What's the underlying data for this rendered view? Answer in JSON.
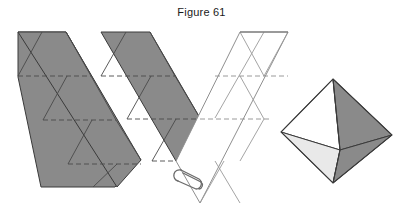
{
  "figure": {
    "caption": "Figure 61",
    "background_color": "#ffffff"
  },
  "palette": {
    "shaded_face": "#8a8a8a",
    "shaded_face_dark": "#7e7e7e",
    "unshaded_face": "#ffffff",
    "pale_face": "#e9e9e9",
    "outline": "#3a3a3a",
    "fold_line": "#4a4a4a",
    "dashed_fold": "#4a4a4a",
    "light_edge": "#9a9a9a",
    "paperclip": "#6b6b6b",
    "caption_color": "#1a1a1a"
  },
  "objects": {
    "left_strip": {
      "name": "shaded-triangle-strip",
      "fill": "#8a8a8a",
      "triangle_count": 8,
      "orientation": "diagonal-down-right",
      "outline": [
        [
          18,
          32
        ],
        [
          66,
          32
        ],
        [
          140,
          159
        ],
        [
          114,
          186
        ]
      ],
      "fold_lines_solid": [
        [
          [
            43,
            32
          ],
          [
            18,
            76
          ]
        ],
        [
          [
            66,
            32
          ],
          [
            92,
            76
          ]
        ],
        [
          [
            43,
            76
          ],
          [
            68,
            120
          ]
        ],
        [
          [
            92,
            76
          ],
          [
            117,
            120
          ]
        ],
        [
          [
            92,
            120
          ],
          [
            116,
            163
          ]
        ],
        [
          [
            117,
            120
          ],
          [
            92,
            163
          ]
        ]
      ],
      "fold_lines_dashed": [
        [
          [
            18,
            76
          ],
          [
            92,
            76
          ]
        ],
        [
          [
            43,
            120
          ],
          [
            117,
            120
          ]
        ],
        [
          [
            68,
            163
          ],
          [
            140,
            163
          ]
        ]
      ]
    },
    "chevron_net": {
      "name": "chevron-net",
      "left_arm_fill": "#8a8a8a",
      "right_arm_fill": "#ffffff",
      "left_arm_outline": [
        [
          101,
          32
        ],
        [
          150,
          32
        ],
        [
          199,
          117
        ],
        [
          175,
          160
        ]
      ],
      "right_arm_outline": [
        [
          199,
          117
        ],
        [
          240,
          32
        ],
        [
          288,
          32
        ],
        [
          199,
          203
        ]
      ],
      "fold_lines_dashed": [
        [
          [
            101,
            76
          ],
          [
            175,
            76
          ]
        ],
        [
          [
            126,
            119
          ],
          [
            199,
            119
          ]
        ],
        [
          [
            199,
            119
          ],
          [
            272,
            119
          ]
        ],
        [
          [
            175,
            160
          ],
          [
            223,
            160
          ]
        ],
        [
          [
            223,
            76
          ],
          [
            272,
            76
          ]
        ]
      ],
      "attached_paperclip": true
    },
    "paperclip": {
      "name": "paper-clip",
      "color": "#6b6b6b",
      "position": [
        176,
        168
      ]
    },
    "octahedron": {
      "name": "octahedron-solid",
      "vertices": {
        "top": [
          333,
          79
        ],
        "left": [
          281,
          132
        ],
        "right": [
          392,
          135
        ],
        "bottom": [
          333,
          183
        ],
        "front": [
          340,
          150
        ]
      },
      "faces": [
        {
          "name": "upper-left-face",
          "fill": "#ffffff"
        },
        {
          "name": "upper-right-face",
          "fill": "#8a8a8a"
        },
        {
          "name": "lower-left-face",
          "fill": "#e9e9e9"
        },
        {
          "name": "lower-right-face",
          "fill": "#8a8a8a"
        }
      ]
    }
  }
}
